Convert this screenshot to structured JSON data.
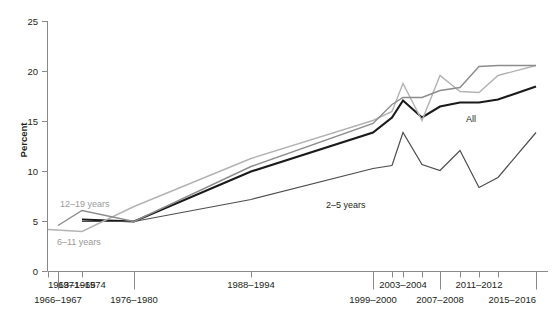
{
  "chart_data": {
    "type": "line",
    "title": "",
    "xlabel": "",
    "ylabel": "Percent",
    "ylim": [
      0,
      25
    ],
    "yticks": [
      0,
      5,
      10,
      15,
      20,
      25
    ],
    "ytick_labels": [
      "0",
      "5",
      "10",
      "15",
      "20",
      "25"
    ],
    "grid": false,
    "legend_position": "inline-annotations",
    "categories": [
      "1963-1965",
      "1966-1967",
      "1971-1974",
      "1976-1980",
      "1988-1994",
      "1999-2000",
      "2001-2002",
      "2003-2004",
      "2005-2006",
      "2007-2008",
      "2009-2010",
      "2011-2012",
      "2013-2014",
      "2015-2016"
    ],
    "xtick_labels_upper": [
      "1963–1965",
      "1971–1974",
      "1988–1994",
      "2003–2004",
      "2011–2012"
    ],
    "xtick_labels_lower": [
      "1966–1967",
      "1976–1980",
      "1999–2000",
      "2007–2008",
      "2015–2016"
    ],
    "series": [
      {
        "name": "All",
        "label": "All",
        "color": "#1a1a1a",
        "width": 2.1,
        "x": [
          "1971-1974",
          "1976-1980",
          "1988-1994",
          "1999-2000",
          "2001-2002",
          "2003-2004",
          "2005-2006",
          "2007-2008",
          "2009-2010",
          "2011-2012",
          "2013-2014",
          "2015-2016"
        ],
        "values": [
          5.2,
          5.0,
          10.0,
          13.9,
          15.4,
          17.1,
          15.4,
          16.5,
          16.9,
          16.9,
          17.2,
          18.5
        ]
      },
      {
        "name": "2-5 years",
        "label": "2–5 years",
        "color": "#4d4d4d",
        "width": 1.2,
        "x": [
          "1971-1974",
          "1976-1980",
          "1988-1994",
          "1999-2000",
          "2001-2002",
          "2003-2004",
          "2005-2006",
          "2007-2008",
          "2009-2010",
          "2011-2012",
          "2013-2014",
          "2015-2016"
        ],
        "values": [
          5.0,
          5.0,
          7.2,
          10.3,
          10.6,
          13.9,
          10.7,
          10.1,
          12.1,
          8.4,
          9.4,
          13.9
        ]
      },
      {
        "name": "6-11 years",
        "label": "6–11 years",
        "color": "#b3b3b3",
        "width": 1.4,
        "x": [
          "1963-1965",
          "1971-1974",
          "1976-1980",
          "1988-1994",
          "1999-2000",
          "2001-2002",
          "2003-2004",
          "2005-2006",
          "2007-2008",
          "2009-2010",
          "2011-2012",
          "2013-2014",
          "2015-2016"
        ],
        "values": [
          4.2,
          4.0,
          6.5,
          11.3,
          15.1,
          16.0,
          18.8,
          15.1,
          19.6,
          18.0,
          17.9,
          19.6,
          20.6
        ]
      },
      {
        "name": "12-19 years",
        "label": "12–19 years",
        "color": "#8c8c8c",
        "width": 1.4,
        "x": [
          "1966-1967",
          "1971-1974",
          "1976-1980",
          "1988-1994",
          "1999-2000",
          "2001-2002",
          "2003-2004",
          "2005-2006",
          "2007-2008",
          "2009-2010",
          "2011-2012",
          "2013-2014",
          "2015-2016"
        ],
        "values": [
          4.6,
          6.1,
          5.0,
          10.5,
          14.8,
          16.7,
          17.4,
          17.4,
          18.1,
          18.4,
          20.5,
          20.6,
          20.6
        ]
      }
    ],
    "annotations": [
      {
        "text": "12–19 years",
        "series": "12-19 years"
      },
      {
        "text": "6–11 years",
        "series": "6-11 years"
      },
      {
        "text": "2–5 years",
        "series": "2-5 years"
      },
      {
        "text": "All",
        "series": "All"
      }
    ]
  }
}
